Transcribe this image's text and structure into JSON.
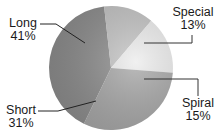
{
  "chart_data": {
    "type": "pie",
    "title": "",
    "categories": [
      "Long",
      "Special",
      "Spiral",
      "Short"
    ],
    "values": [
      41,
      13,
      15,
      31
    ],
    "unit": "%",
    "labels": [
      "Long 41%",
      "Special 13%",
      "Spiral 15%",
      "Short 31%"
    ],
    "colors": [
      "#8c8c8c",
      "#c3c3c3",
      "#ececec",
      "#a6a6a6"
    ],
    "start_angle_deg_clockwise_from_top": 206,
    "legend": "none (leader-line labels)"
  },
  "labels": {
    "long": {
      "name": "Long",
      "pct": "41%"
    },
    "special": {
      "name": "Special",
      "pct": "13%"
    },
    "spiral": {
      "name": "Spiral",
      "pct": "15%"
    },
    "short": {
      "name": "Short",
      "pct": "31%"
    }
  }
}
